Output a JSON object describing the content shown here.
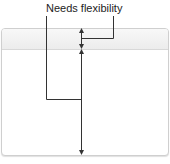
{
  "annotation": {
    "label": "Needs flexibility"
  },
  "colors": {
    "line": "#333333",
    "border": "#cfcfcf",
    "header": "#eeeeee"
  }
}
